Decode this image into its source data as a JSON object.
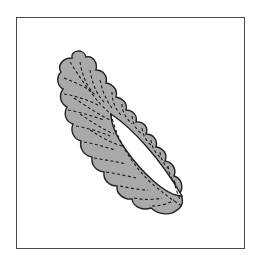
{
  "figure": {
    "colors": {
      "fill": "#a9a9a9",
      "outline": "#222222",
      "stitch": "#1a1a1a",
      "frame": "#4a4a4a",
      "background": "#ffffff"
    }
  }
}
